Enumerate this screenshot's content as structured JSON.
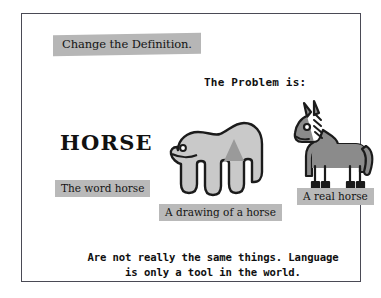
{
  "slide": {
    "title": "Change the Definition.",
    "problem_heading": "The Problem is:",
    "word_specimen": "HORSE",
    "captions": {
      "word": "The word horse",
      "drawing": "A drawing of a horse",
      "real": "A real horse"
    },
    "conclusion": {
      "line1": "Are not really the same things. Language",
      "line2": "is only a tool in the world."
    }
  },
  "artwork": {
    "drawing_of_horse": "hand-shaped-horse-drawing",
    "real_horse": "cartoon-horse-drawing"
  },
  "colors": {
    "page_background": "#ffffff",
    "frame_border": "#4a4a55",
    "marker_highlight": "#b9b9b9",
    "text": "#101010",
    "hand_fill": "#c9c9c9",
    "hand_mane": "#9a9a9a",
    "horse_fill": "#8b8b8b",
    "ink": "#1b1b1b"
  }
}
